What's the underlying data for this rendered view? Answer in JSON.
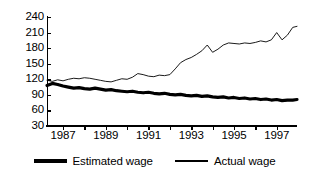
{
  "chart_data": {
    "type": "line",
    "title": "",
    "subtitle": "",
    "xlabel": "",
    "ylabel": "",
    "xlim": [
      1986.25,
      1997.95
    ],
    "ylim": [
      30,
      240
    ],
    "grid": false,
    "legend_position": "bottom-center",
    "y_ticks": [
      240,
      210,
      180,
      150,
      120,
      90,
      60,
      30
    ],
    "y_tick_labels": [
      "240",
      "210",
      "180",
      "150",
      "120",
      "90",
      "60",
      "30"
    ],
    "x_ticks": [
      1987,
      1988,
      1989,
      1990,
      1991,
      1992,
      1993,
      1994,
      1995,
      1996,
      1997
    ],
    "x_tick_labels": [
      "1987",
      "",
      "1989",
      "",
      "1991",
      "",
      "1993",
      "",
      "1995",
      "",
      "1997"
    ],
    "x": [
      1986.25,
      1986.5,
      1986.75,
      1987.0,
      1987.25,
      1987.5,
      1987.75,
      1988.0,
      1988.25,
      1988.5,
      1988.75,
      1989.0,
      1989.25,
      1989.5,
      1989.75,
      1990.0,
      1990.25,
      1990.5,
      1990.75,
      1991.0,
      1991.25,
      1991.5,
      1991.75,
      1992.0,
      1992.25,
      1992.5,
      1992.75,
      1993.0,
      1993.25,
      1993.5,
      1993.75,
      1994.0,
      1994.25,
      1994.5,
      1994.75,
      1995.0,
      1995.25,
      1995.5,
      1995.75,
      1996.0,
      1996.25,
      1996.5,
      1996.75,
      1997.0,
      1997.25,
      1997.5,
      1997.75,
      1997.95
    ],
    "series": [
      {
        "name": "Estimated wage",
        "line_style": "thick",
        "color": "#000000",
        "values": [
          108,
          112,
          110,
          107,
          105,
          103,
          104,
          102,
          101,
          103,
          101,
          99,
          100,
          98,
          97,
          96,
          97,
          95,
          94,
          95,
          93,
          92,
          93,
          91,
          90,
          91,
          89,
          88,
          89,
          87,
          88,
          86,
          85,
          86,
          84,
          85,
          83,
          84,
          82,
          83,
          81,
          82,
          80,
          81,
          79,
          80,
          80,
          81
        ]
      },
      {
        "name": "Actual wage",
        "line_style": "thin",
        "color": "#000000",
        "values": [
          118,
          116,
          119,
          117,
          120,
          122,
          121,
          123,
          122,
          120,
          118,
          116,
          115,
          118,
          121,
          120,
          124,
          131,
          129,
          126,
          125,
          128,
          127,
          129,
          140,
          152,
          158,
          162,
          168,
          175,
          186,
          172,
          178,
          186,
          190,
          189,
          188,
          190,
          189,
          191,
          194,
          192,
          196,
          210,
          196,
          205,
          220,
          222
        ]
      }
    ]
  },
  "legend": {
    "items": [
      {
        "label": "Estimated wage",
        "style": "thick"
      },
      {
        "label": "Actual wage",
        "style": "thin"
      }
    ]
  }
}
